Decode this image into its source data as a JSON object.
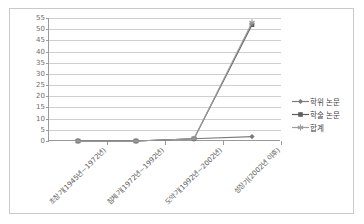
{
  "chart_data": {
    "type": "line",
    "title": "",
    "xlabel": "",
    "ylabel": "",
    "ylim": [
      0,
      55
    ],
    "ytick_step": 5,
    "yticks": [
      55,
      50,
      45,
      40,
      35,
      30,
      25,
      20,
      15,
      10,
      5,
      0
    ],
    "grid": true,
    "legend_position": "right",
    "categories": [
      "초창기(1945년~1972년)",
      "침체기(1972년~1992년)",
      "도약기(1992년~2002년)",
      "성장기(2002년 이후)"
    ],
    "series": [
      {
        "name": "학위 논문",
        "marker": "diamond",
        "color": "#7b7b7b",
        "values": [
          0,
          0,
          1,
          2
        ]
      },
      {
        "name": "학술 논문",
        "marker": "square",
        "color": "#5e5e5e",
        "values": [
          0,
          0,
          1,
          52
        ]
      },
      {
        "name": "합계",
        "marker": "asterisk",
        "color": "#9d9d9d",
        "values": [
          0,
          0,
          1,
          53
        ]
      }
    ]
  },
  "legend": {
    "items": [
      {
        "label": "학위 논문"
      },
      {
        "label": "학술 논문"
      },
      {
        "label": "합계"
      }
    ]
  },
  "colors": {
    "frame_border": "#c9c9c9",
    "axis": "#9a9a9a",
    "gridline": "#cfcfcf",
    "tick_text": "#6d6d6d",
    "label_text": "#5a5a5a",
    "plot_background": "#ffffff"
  }
}
